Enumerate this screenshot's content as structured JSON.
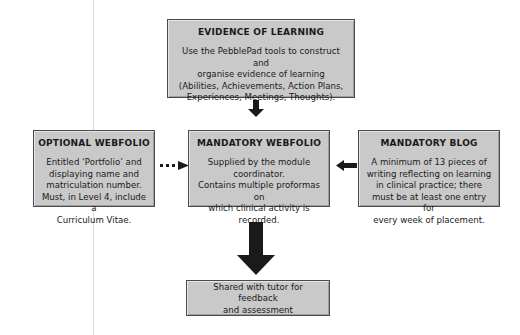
{
  "diagram": {
    "background_color": "#ffffff",
    "box_fill_color": "#c9c9c9",
    "box_border_color": "#4a4a4a",
    "arrow_color": "#1a1a1a",
    "nodes": [
      {
        "id": "evidence-of-learning",
        "title": "EVIDENCE OF LEARNING",
        "body": "Use the PebblePad tools to construct and\norganise evidence of learning\n(Abilities, Achievements, Action Plans,\nExperiences, Meetings, Thoughts)."
      },
      {
        "id": "optional-webfolio",
        "title": "OPTIONAL WEBFOLIO",
        "body": "Entitled ‘Portfolio’ and\ndisplaying name and\nmatriculation number.\nMust, in Level 4, include a\nCurriculum Vitae."
      },
      {
        "id": "mandatory-webfolio",
        "title": "MANDATORY WEBFOLIO",
        "body": "Supplied by the module\ncoordinator.\nContains multiple proformas on\nwhich clinical activity is\nrecorded."
      },
      {
        "id": "mandatory-blog",
        "title": "MANDATORY BLOG",
        "body": "A minimum of 13 pieces of\nwriting reflecting on learning\nin clinical practice; there\nmust be at least one entry for\nevery week of placement."
      },
      {
        "id": "shared-with-tutor",
        "title": "",
        "body": "Shared with tutor for feedback\nand assessment"
      }
    ],
    "connectors": [
      {
        "id": "evidence-to-mandatory-webfolio",
        "style": "solid",
        "direction": "down"
      },
      {
        "id": "optional-to-mandatory-webfolio",
        "style": "dotted",
        "direction": "right",
        "dots": 3
      },
      {
        "id": "blog-to-mandatory-webfolio",
        "style": "solid",
        "direction": "left"
      },
      {
        "id": "mandatory-webfolio-to-shared",
        "style": "solid",
        "direction": "down"
      }
    ]
  }
}
